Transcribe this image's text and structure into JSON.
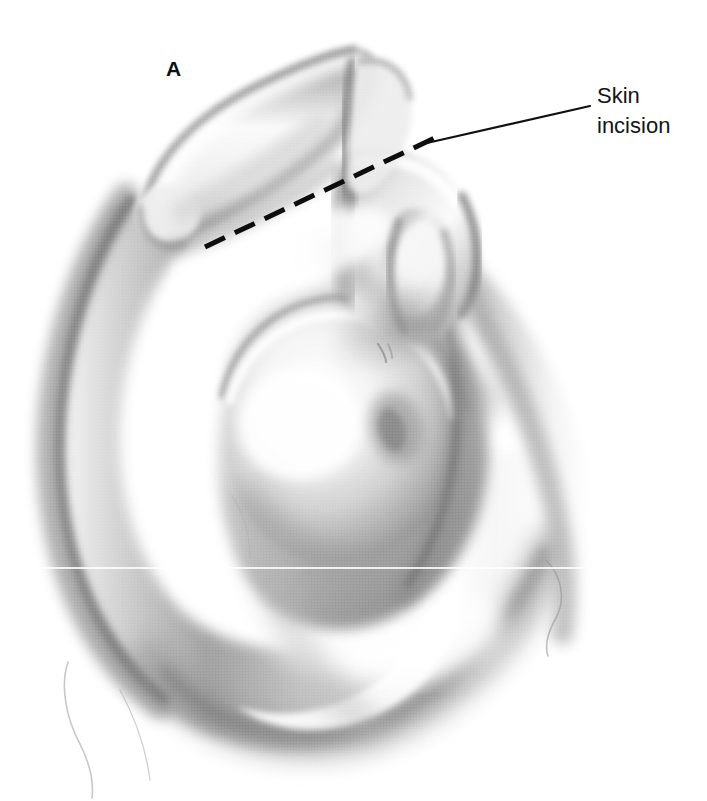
{
  "figure": {
    "panel_letter": "A",
    "style": "graphite / airbrush medical illustration, halftone grayscale",
    "background_color": "#ffffff",
    "width_px": 707,
    "height_px": 801
  },
  "callout": {
    "line1": "Skin",
    "line2": "incision",
    "full_text": "Skin incision",
    "text_color": "#141414",
    "leader_line": {
      "color": "#101010",
      "width_px": 2,
      "from_x": 590,
      "from_y": 106,
      "to_x": 418,
      "to_y": 145
    }
  },
  "incision_marking": {
    "name": "skin-incision-dashed-line",
    "style": "dashed",
    "color": "#0d0d0d",
    "stroke_px": 5,
    "dash_px": 22,
    "gap_px": 11,
    "from_x": 205,
    "from_y": 247,
    "to_x": 443,
    "to_y": 134
  },
  "anatomy_labels": {
    "clavicle": "clavicle",
    "acromioclavicular_joint": "acromioclavicular joint",
    "acromion": "acromion",
    "coracoid_process": "coracoid process",
    "humeral_head": "humeral head",
    "deltoid": "deltoid muscle",
    "arm": "upper arm"
  },
  "tones": {
    "lightest": "#ffffff",
    "light": "#f2f2f2",
    "mid_light": "#d8d8d8",
    "mid": "#b4b4b4",
    "mid_dark": "#949494",
    "dark": "#6f6f6f",
    "darkest": "#3c3c3c",
    "ink": "#101010"
  }
}
